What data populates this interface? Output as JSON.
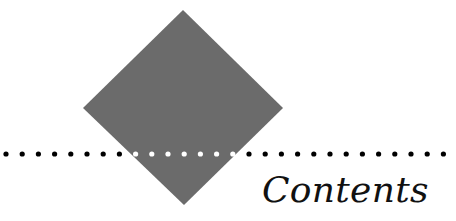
{
  "heading": {
    "title": "Contents"
  },
  "decoration": {
    "diamond_color": "#6b6b6b",
    "dot_color": "#000000",
    "dot_on_diamond_color": "#ffffff",
    "dot_count": 28
  }
}
